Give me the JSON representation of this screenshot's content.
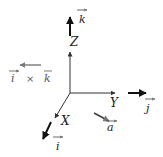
{
  "diagram": {
    "title": "",
    "axes": {
      "z": {
        "label": "Z"
      },
      "y": {
        "label": "Y"
      },
      "x": {
        "label": "X"
      }
    },
    "vectors": {
      "k": {
        "label": "k",
        "overline": "→"
      },
      "j": {
        "label": "j",
        "overline": "→"
      },
      "i": {
        "label": "i",
        "overline": "→"
      },
      "a": {
        "label": "a",
        "overline": "→"
      },
      "cross": {
        "left": "i",
        "op": "×",
        "right": "k"
      }
    },
    "colors": {
      "axis": "#333333",
      "vector_dark": "#111111",
      "vector_gray": "#666666"
    }
  }
}
